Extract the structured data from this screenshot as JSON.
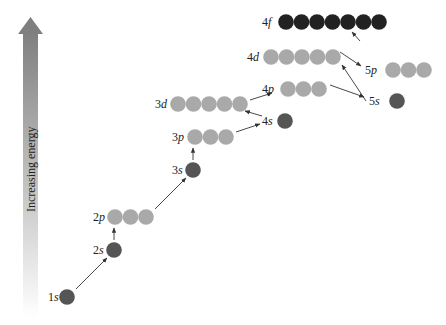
{
  "axis": {
    "label": "Increasing energy",
    "gradient_top": "#7f7f7f",
    "gradient_bottom": "#ffffff"
  },
  "colors": {
    "s_orbital": "#555555",
    "p_orbital": "#a9a9a9",
    "d_orbital": "#a9a9a9",
    "f_orbital": "#222222",
    "arrow": "#333333"
  },
  "orbitals": [
    {
      "id": "1s",
      "n": "1",
      "l": "s",
      "count": 1,
      "x": 67,
      "y": 297,
      "labelX": 48,
      "type": "s"
    },
    {
      "id": "2s",
      "n": "2",
      "l": "s",
      "count": 1,
      "x": 114,
      "y": 250,
      "labelX": 93,
      "type": "s"
    },
    {
      "id": "2p",
      "n": "2",
      "l": "p",
      "count": 3,
      "x": 115,
      "y": 217,
      "labelX": 93,
      "type": "p"
    },
    {
      "id": "3s",
      "n": "3",
      "l": "s",
      "count": 1,
      "x": 193,
      "y": 170,
      "labelX": 172,
      "type": "s"
    },
    {
      "id": "3p",
      "n": "3",
      "l": "p",
      "count": 3,
      "x": 195,
      "y": 137,
      "labelX": 172,
      "type": "p"
    },
    {
      "id": "4s",
      "n": "4",
      "l": "s",
      "count": 1,
      "x": 285,
      "y": 121,
      "labelX": 262,
      "type": "s"
    },
    {
      "id": "3d",
      "n": "3",
      "l": "d",
      "count": 5,
      "x": 178,
      "y": 104,
      "labelX": 155,
      "type": "d"
    },
    {
      "id": "4p",
      "n": "4",
      "l": "p",
      "count": 3,
      "x": 288,
      "y": 89,
      "labelX": 262,
      "type": "p"
    },
    {
      "id": "5s",
      "n": "5",
      "l": "s",
      "count": 1,
      "x": 397,
      "y": 101,
      "labelX": 369,
      "type": "s"
    },
    {
      "id": "4d",
      "n": "4",
      "l": "d",
      "count": 5,
      "x": 271,
      "y": 57,
      "labelX": 247,
      "type": "d"
    },
    {
      "id": "5p",
      "n": "5",
      "l": "p",
      "count": 3,
      "x": 393,
      "y": 70,
      "labelX": 365,
      "type": "p"
    },
    {
      "id": "4f",
      "n": "4",
      "l": "f",
      "count": 7,
      "x": 286,
      "y": 22,
      "labelX": 262,
      "type": "f"
    }
  ],
  "arrows": [
    {
      "from": "1s",
      "to": "2s",
      "x1": 76,
      "y1": 289,
      "x2": 107,
      "y2": 258
    },
    {
      "from": "2s",
      "to": "2p",
      "x1": 114,
      "y1": 240,
      "x2": 114,
      "y2": 228
    },
    {
      "from": "2p",
      "to": "3s",
      "x1": 155,
      "y1": 209,
      "x2": 186,
      "y2": 178
    },
    {
      "from": "3s",
      "to": "3p",
      "x1": 193,
      "y1": 160,
      "x2": 193,
      "y2": 148
    },
    {
      "from": "3p",
      "to": "4s",
      "x1": 236,
      "y1": 132,
      "x2": 260,
      "y2": 124
    },
    {
      "from": "4s",
      "to": "3d",
      "x1": 262,
      "y1": 116,
      "x2": 245,
      "y2": 111
    },
    {
      "from": "3d",
      "to": "4p",
      "x1": 250,
      "y1": 100,
      "x2": 272,
      "y2": 93
    },
    {
      "from": "4p",
      "to": "5s",
      "x1": 330,
      "y1": 85,
      "x2": 364,
      "y2": 97
    },
    {
      "from": "5s",
      "to": "4d",
      "x1": 366,
      "y1": 101,
      "x2": 342,
      "y2": 65
    },
    {
      "from": "4d",
      "to": "5p",
      "x1": 340,
      "y1": 52,
      "x2": 361,
      "y2": 66
    },
    {
      "from": "5p",
      "to": "4f",
      "x1": 360,
      "y1": 41,
      "x2": 352,
      "y2": 32
    }
  ]
}
